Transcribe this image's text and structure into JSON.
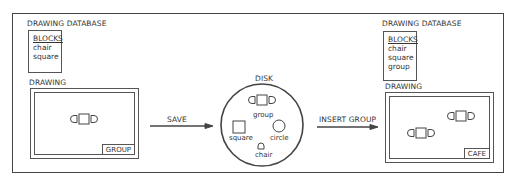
{
  "left": {
    "database_label": "DRAWING DATABASE",
    "blocks_header": "BLOCKS",
    "blocks": [
      "chair",
      "square"
    ],
    "drawing_label": "DRAWING",
    "title_block": "GROUP"
  },
  "arrows": {
    "save": "SAVE",
    "insert": "INSERT GROUP"
  },
  "disk": {
    "label": "DISK",
    "items": {
      "group": "group",
      "square": "square",
      "circle": "circle",
      "chair": "chair"
    }
  },
  "right": {
    "database_label": "DRAWING DATABASE",
    "blocks_header": "BLOCKS",
    "blocks": [
      "chair",
      "square",
      "group"
    ],
    "drawing_label": "DRAWING",
    "title_block": "CAFE"
  },
  "colors": {
    "line": "#444444",
    "background": "#ffffff"
  }
}
